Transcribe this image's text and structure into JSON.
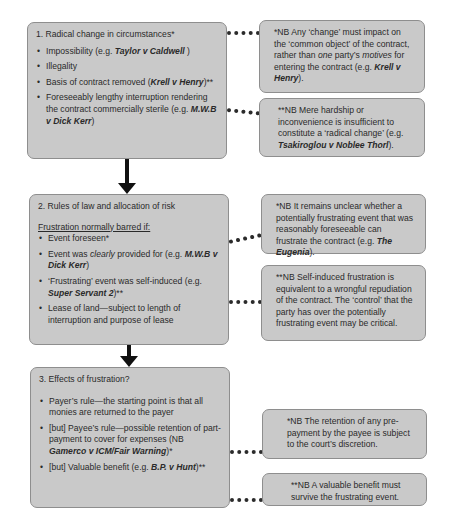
{
  "box1": {
    "title": "1. Radical change in circumstances*",
    "items": [
      {
        "pre": "Impossibility (e.g. ",
        "case": "Taylor v Caldwell",
        "post": " )"
      },
      {
        "pre": "Illegality",
        "case": "",
        "post": ""
      },
      {
        "pre": "Basis of contract removed (",
        "case": "Krell v Henry",
        "post": ")**"
      },
      {
        "pre": "Foreseeably lengthy interruption rendering the contract commercially sterile (e.g. ",
        "case": "M.W.B v Dick Kerr",
        "post": ")"
      }
    ]
  },
  "note1a": {
    "pre": "*NB Any ‘change’ must impact  on the ‘common object’ of the contract, rather than ",
    "em1": "one",
    "mid": " party’s ",
    "em2": "motives",
    "mid2": " for entering the contract (e.g. ",
    "case": "Krell v Henry",
    "post": ")."
  },
  "note1b": {
    "pre": "**NB Mere hardship or inconvenience is insufficient to constitute a ‘radical change’ (e.g. ",
    "case": "Tsakiroglou v Noblee Thorl",
    "post": ")."
  },
  "box2": {
    "title": "2. Rules of law and allocation of risk",
    "subtitle": "Frustration normally barred if:",
    "items": [
      {
        "pre": "Event foreseen*",
        "em": "",
        "mid": "",
        "case": "",
        "post": ""
      },
      {
        "pre": "Event was ",
        "em": "clearly",
        "mid": " provided for (e.g. ",
        "case": "M.W.B v Dick Kerr",
        "post": ")"
      },
      {
        "pre": "‘Frustrating’ event was self-induced (e.g. ",
        "em": "",
        "mid": "",
        "case": "Super Servant 2",
        "post": ")**"
      },
      {
        "pre": "Lease of land—subject to length of interruption and purpose of lease",
        "em": "",
        "mid": "",
        "case": "",
        "post": ""
      }
    ]
  },
  "note2a": {
    "pre": "*NB It remains unclear whether a potentially frustrating event that was reasonably foreseeable can frustrate the contract (e.g. ",
    "case": "The Eugenia",
    "post": ")."
  },
  "note2b": {
    "text": "**NB Self-induced frustration is equivalent to a wrongful repudiation of the contract. The ‘control’ that the party has over the potentially frustrating event may be critical."
  },
  "box3": {
    "title": "3. Effects of frustration?",
    "items": [
      {
        "pre": "Payer’s rule—the starting point is that all monies are returned to the payer",
        "case": "",
        "post": ""
      },
      {
        "pre": "[but] Payee’s rule—possible retention of part-payment to cover for expenses (NB ",
        "case": "Gamerco v ICM/Fair Warning",
        "post": ")*"
      },
      {
        "pre": "[but] Valuable benefit (e.g. ",
        "case": "B.P. v Hunt",
        "post": ")**"
      }
    ]
  },
  "note3a": {
    "text": "*NB The retention of any pre-payment by the payee is subject to the court’s discretion."
  },
  "note3b": {
    "text": "**NB A valuable benefit must survive the frustrating event."
  },
  "colors": {
    "box_fill": "#c9c9c9",
    "box_border": "#8e8e8e",
    "connector": "#111111"
  }
}
